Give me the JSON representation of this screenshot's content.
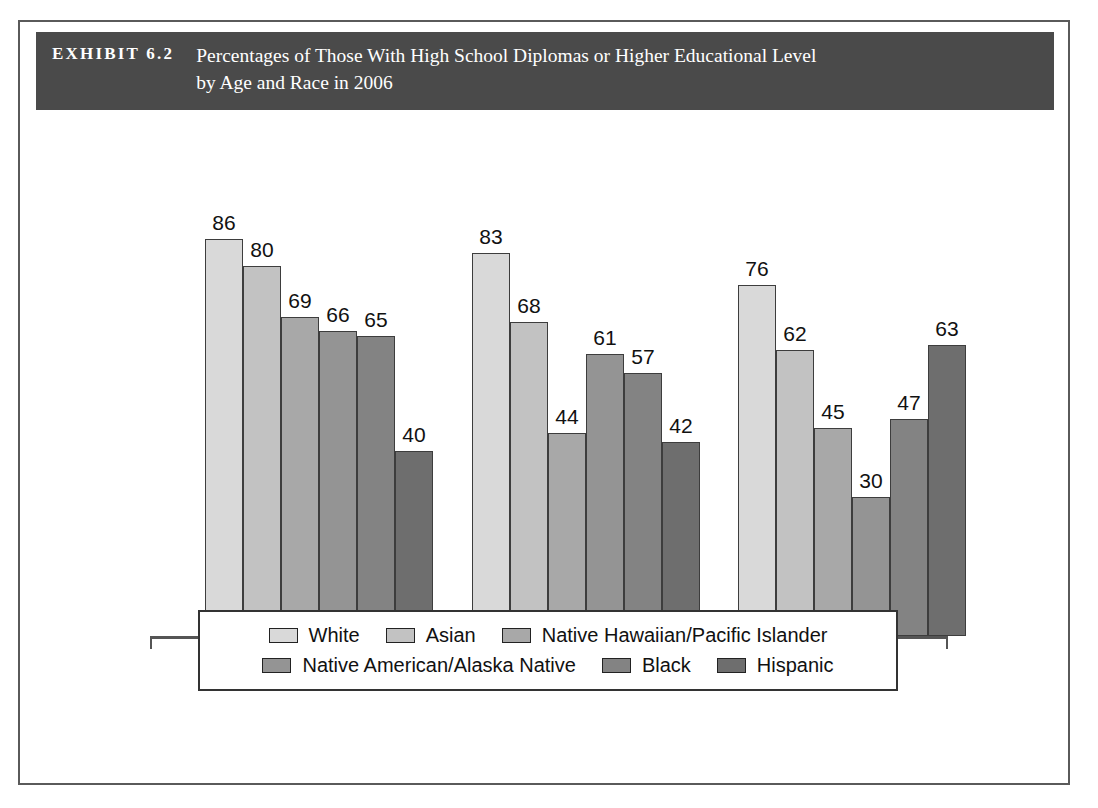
{
  "exhibit": {
    "number": "EXHIBIT 6.2",
    "title_line_1": "Percentages of Those With High School Diplomas or Higher Educational Level",
    "title_line_2": "by Age and Race in 2006",
    "header_background": "#4a4a4a",
    "header_text_color": "#ffffff",
    "frame_border_color": "#5a5a5a"
  },
  "chart_data": {
    "type": "bar",
    "title": "Percentages of Those With High School Diplomas or Higher Educational Level by Age and Race in 2006",
    "xlabel": "",
    "ylabel": "",
    "ylim": [
      0,
      100
    ],
    "grid": false,
    "legend_position": "bottom",
    "categories": [
      "65–69",
      "70–74",
      "75+"
    ],
    "series": [
      {
        "name": "White",
        "color": "#d9d9d9",
        "values": [
          86,
          83,
          76
        ]
      },
      {
        "name": "Asian",
        "color": "#c2c2c2",
        "values": [
          80,
          68,
          62
        ]
      },
      {
        "name": "Native Hawaiian/Pacific Islander",
        "color": "#a8a8a8",
        "values": [
          69,
          44,
          45
        ]
      },
      {
        "name": "Native American/Alaska Native",
        "color": "#949494",
        "values": [
          66,
          61,
          30
        ]
      },
      {
        "name": "Black",
        "color": "#838383",
        "values": [
          65,
          57,
          47
        ]
      },
      {
        "name": "Hispanic",
        "color": "#6e6e6e",
        "values": [
          40,
          42,
          63
        ]
      }
    ]
  },
  "axis": {
    "tick_color": "#555555",
    "baseline_color": "#555555"
  },
  "legend": {
    "row1": [
      "White",
      "Asian",
      "Native Hawaiian/Pacific Islander"
    ],
    "row2": [
      "Native American/Alaska Native",
      "Black",
      "Hispanic"
    ]
  }
}
